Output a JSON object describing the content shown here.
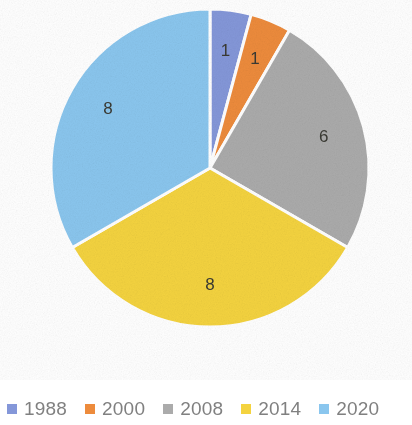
{
  "chart_data": {
    "type": "pie",
    "title": "",
    "categories": [
      "1988",
      "2000",
      "2008",
      "2014",
      "2020"
    ],
    "values": [
      1,
      1,
      6,
      8,
      8
    ],
    "total": 24,
    "data_labels": [
      "1",
      "1",
      "6",
      "8",
      "8"
    ],
    "data_label_mode": "value",
    "colors": [
      "#8497D9",
      "#ED8B3C",
      "#ABABAB",
      "#F4D33F",
      "#8AC6EE"
    ],
    "slice_border_color": "#FFFFFF",
    "start_angle_deg": 0,
    "direction": "clockwise",
    "legend": {
      "position": "bottom",
      "orientation": "horizontal",
      "entries": [
        {
          "label": "1988",
          "color": "#8497D9"
        },
        {
          "label": "2000",
          "color": "#ED8B3C"
        },
        {
          "label": "2008",
          "color": "#ABABAB"
        },
        {
          "label": "2014",
          "color": "#F4D33F"
        },
        {
          "label": "2020",
          "color": "#8AC6EE"
        }
      ]
    },
    "geometry": {
      "center_x": 210,
      "center_y": 168,
      "radius": 159
    },
    "background_color": "#FFFFFF",
    "label_text_color": "#3A3A33",
    "legend_text_color": "#808080"
  }
}
